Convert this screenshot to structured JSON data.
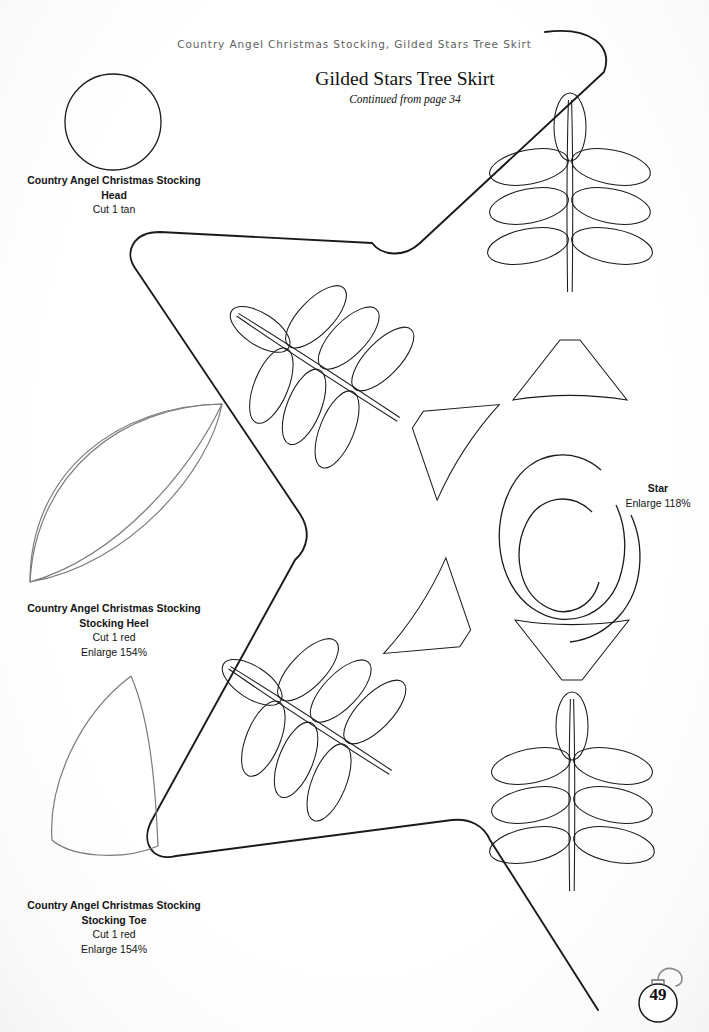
{
  "page": {
    "running_head": "Country Angel Christmas Stocking, Gilded Stars Tree Skirt",
    "page_number": "49",
    "background_color": "#fdfdfd",
    "ink_color": "#1a1a1a",
    "secondary_ink_color": "#6b6b6b"
  },
  "title_block": {
    "title": "Gilded Stars Tree Skirt",
    "subtitle": "Continued from page 34"
  },
  "captions": {
    "head": {
      "line1": "Country Angel Christmas Stocking",
      "line2": "Head",
      "line3": "Cut 1 tan"
    },
    "heel": {
      "line1": "Country Angel Christmas Stocking",
      "line2": "Stocking Heel",
      "line3": "Cut 1 red",
      "line4": "Enlarge 154%"
    },
    "toe": {
      "line1": "Country Angel Christmas Stocking",
      "line2": "Stocking Toe",
      "line3": "Cut 1 red",
      "line4": "Enlarge 154%"
    },
    "star": {
      "line1": "Star",
      "line2": "Enlarge 118%"
    }
  },
  "patterns": [
    {
      "name": "head-circle-pattern",
      "shape": "circle",
      "ink": "#1a1a1a"
    },
    {
      "name": "heel-lens-pattern",
      "shape": "lens",
      "ink": "#6b6b6b"
    },
    {
      "name": "toe-petal-pattern",
      "shape": "petal",
      "ink": "#6b6b6b"
    },
    {
      "name": "star-outline-pattern",
      "shape": "rounded-star",
      "ink": "#1a1a1a"
    },
    {
      "name": "leaf-sprig-motif",
      "shape": "sprig",
      "ink": "#1a1a1a"
    },
    {
      "name": "spiral-ring-motif",
      "shape": "double-c-spiral",
      "ink": "#1a1a1a"
    }
  ],
  "page_badge": {
    "number": "49",
    "ornament": "ornament-hook-icon"
  }
}
